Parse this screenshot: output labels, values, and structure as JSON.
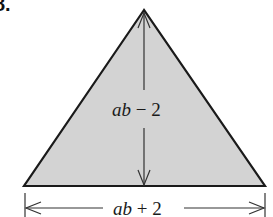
{
  "problem_number": "8.",
  "figure": {
    "shape": "triangle",
    "fill_color": "#d3d3d3",
    "stroke_color": "#1a1a1a",
    "height_label_var": "ab",
    "height_label_rest": " − 2",
    "base_label_var": "ab",
    "base_label_rest": " + 2"
  }
}
